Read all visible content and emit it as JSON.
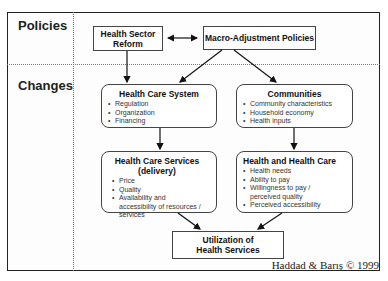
{
  "rows": {
    "policies_label": "Policies",
    "changes_label": "Changes"
  },
  "boxes": {
    "health_sector_reform": "Health Sector Reform",
    "macro_adjustment": "Macro-Adjustment Policies",
    "health_care_system": {
      "title": "Health Care System",
      "items": [
        "Regulation",
        "Organization",
        "Financing"
      ]
    },
    "communities": {
      "title": "Communities",
      "items": [
        "Community characteristics",
        "Household economy",
        "Health inputs"
      ]
    },
    "health_care_services": {
      "title": "Health Care Services (delivery)",
      "items": [
        "Price",
        "Quality",
        "Availability and accessibility of resources / services"
      ]
    },
    "health_and_health_care": {
      "title": "Health and Health Care",
      "items": [
        "Health needs",
        "Ability to pay",
        "Willingness to pay / perceived quality",
        "Perceived accessibility"
      ]
    },
    "utilization": "Utilization of Health Services"
  },
  "credit": "Haddad & Barış © 1999"
}
